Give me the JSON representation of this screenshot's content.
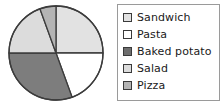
{
  "chart_data": {
    "type": "pie",
    "title": "",
    "categories": [
      "Sandwich",
      "Pasta",
      "Baked potato",
      "Salad",
      "Pizza"
    ],
    "values": [
      25,
      19,
      31,
      19,
      6
    ],
    "unit": "percent",
    "start_angle_deg": 0,
    "direction": "clockwise",
    "legend_position": "right",
    "grid": false,
    "slices": [
      {
        "label": "Sandwich",
        "value": 25,
        "start_deg": 0,
        "end_deg": 90,
        "color": "#e2e2e2"
      },
      {
        "label": "Pasta",
        "value": 19,
        "start_deg": 90,
        "end_deg": 160,
        "color": "#ffffff"
      },
      {
        "label": "Baked potato",
        "value": 31,
        "start_deg": 160,
        "end_deg": 270,
        "color": "#7d7d7d"
      },
      {
        "label": "Salad",
        "value": 19,
        "start_deg": 270,
        "end_deg": 340,
        "color": "#dcdcdc"
      },
      {
        "label": "Pizza",
        "value": 6,
        "start_deg": 340,
        "end_deg": 360,
        "color": "#b4b4b4"
      }
    ]
  },
  "pie": {
    "center_x": 50,
    "center_y": 50,
    "radius": 47,
    "outline_color": "#3c3c3c",
    "outline_width": 1.3
  },
  "legend": {
    "border_color": "#9a9a9a",
    "items": [
      {
        "label": "Sandwich",
        "color": "#e2e2e2"
      },
      {
        "label": "Pasta",
        "color": "#ffffff"
      },
      {
        "label": "Baked potato",
        "color": "#6e6e6e"
      },
      {
        "label": "Salad",
        "color": "#dcdcdc"
      },
      {
        "label": "Pizza",
        "color": "#b4b4b4"
      }
    ]
  }
}
